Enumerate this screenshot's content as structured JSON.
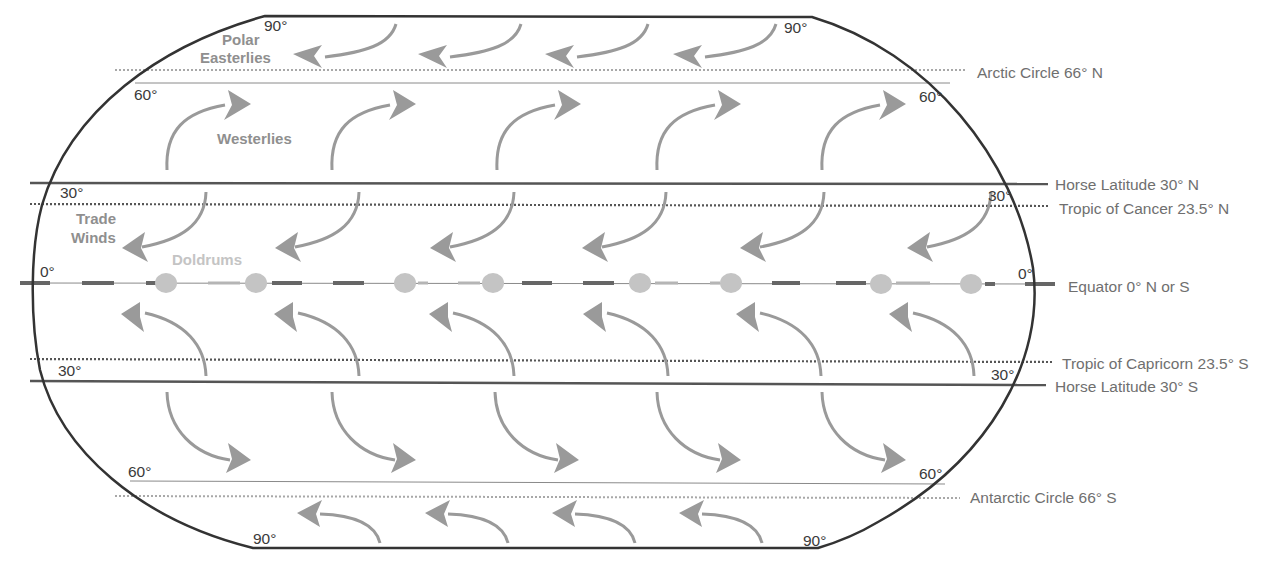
{
  "diagram": {
    "colors": {
      "outline": "#333333",
      "arrow": "#9a9a9a",
      "label_gray": "#6f6f6f",
      "degree_text": "#3a3a3a",
      "wind_label": "#8f8f8f",
      "doldrums": "#c4c4c4"
    },
    "latitude_lines": [
      {
        "id": "arctic-circle",
        "label": "Arctic Circle 66° N",
        "y": 70,
        "style": "dotted"
      },
      {
        "id": "line-60n",
        "label": "",
        "y": 83,
        "style": "thin"
      },
      {
        "id": "horse-latitude-n",
        "label": "Horse Latitude 30° N",
        "y": 184,
        "style": "solid"
      },
      {
        "id": "tropic-cancer",
        "label": "Tropic of Cancer 23.5° N",
        "y": 204,
        "style": "dotted"
      },
      {
        "id": "equator",
        "label": "Equator 0° N or S",
        "y": 283,
        "style": "dashed"
      },
      {
        "id": "tropic-capricorn",
        "label": "Tropic of Capricorn 23.5° S",
        "y": 360,
        "style": "dotted"
      },
      {
        "id": "horse-latitude-s",
        "label": "Horse Latitude 30° S",
        "y": 381,
        "style": "solid"
      },
      {
        "id": "line-60s",
        "label": "",
        "y": 482,
        "style": "thin"
      },
      {
        "id": "antarctic-circle",
        "label": "Antarctic Circle 66° S",
        "y": 496,
        "style": "dotted"
      }
    ],
    "right_labels": {
      "arctic": "Arctic Circle 66° N",
      "horse_n": "Horse Latitude 30° N",
      "cancer": "Tropic of Cancer 23.5° N",
      "equator": "Equator 0° N or S",
      "capricorn": "Tropic of Capricorn 23.5° S",
      "horse_s": "Horse Latitude 30° S",
      "antarctic": "Antarctic Circle 66° S"
    },
    "degree_labels": {
      "top_left_90": "90°",
      "top_right_90": "90°",
      "left_60n": "60°",
      "right_60n": "60°",
      "left_30n": "30°",
      "right_30n": "30°",
      "left_0": "0°",
      "right_0": "0°",
      "left_30s": "30°",
      "right_30s": "30°",
      "left_60s": "60°",
      "right_60s": "60°",
      "bottom_left_90": "90°",
      "bottom_right_90": "90°"
    },
    "wind_labels": {
      "polar_1": "Polar",
      "polar_2": "Easterlies",
      "westerlies": "Westerlies",
      "trade_1": "Trade",
      "trade_2": "Winds",
      "doldrums": "Doldrums"
    },
    "wind_belts": [
      {
        "name": "Polar Easterlies (North)",
        "direction": "east-to-west",
        "arrow_count": 4
      },
      {
        "name": "Westerlies (North)",
        "direction": "west-to-east",
        "arrow_count": 5
      },
      {
        "name": "Trade Winds (North)",
        "direction": "east-to-west",
        "arrow_count": 5
      },
      {
        "name": "Doldrums",
        "direction": "calm",
        "marker_count": 8
      },
      {
        "name": "Trade Winds (South)",
        "direction": "east-to-west",
        "arrow_count": 5
      },
      {
        "name": "Westerlies (South)",
        "direction": "west-to-east",
        "arrow_count": 5
      },
      {
        "name": "Polar Easterlies (South)",
        "direction": "east-to-west",
        "arrow_count": 4
      }
    ]
  }
}
